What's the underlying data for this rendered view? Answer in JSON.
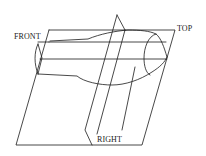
{
  "diagram": {
    "labels": {
      "front": "FRONT",
      "top": "TOP",
      "right": "RIGHT"
    },
    "colors": {
      "background": "#ffffff",
      "stroke": "#1a1a1a"
    }
  }
}
